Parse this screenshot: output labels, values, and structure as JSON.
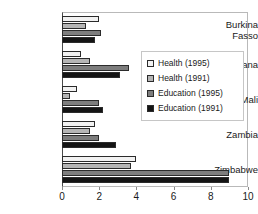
{
  "chart_data": {
    "type": "bar",
    "orientation": "horizontal",
    "title": "",
    "xlabel": "",
    "ylabel": "",
    "xlim": [
      0,
      10
    ],
    "xticks": [
      0,
      2,
      4,
      6,
      8,
      10
    ],
    "xtick_labels": [
      "0",
      "2",
      "4",
      "6",
      "8",
      "10"
    ],
    "grid": false,
    "legend_position": "center-right",
    "categories": [
      "Burkina\nFasso",
      "Ghana",
      "Mali",
      "Zambia",
      "Zimbabwe"
    ],
    "series": [
      {
        "name": "Health (1995)",
        "values": [
          2.0,
          1.0,
          0.8,
          1.8,
          4.0
        ]
      },
      {
        "name": "Health (1991)",
        "values": [
          1.3,
          1.5,
          0.45,
          1.5,
          3.7
        ]
      },
      {
        "name": "Education (1995)",
        "values": [
          2.1,
          3.6,
          2.0,
          2.0,
          9.0
        ]
      },
      {
        "name": "Education (1991)",
        "values": [
          1.8,
          3.1,
          2.2,
          2.9,
          9.0
        ]
      }
    ],
    "series_colors": [
      "#f2f2f2",
      "#b5b5b5",
      "#7d7d7d",
      "#141414"
    ]
  },
  "legend": {
    "items": [
      {
        "label": "Health (1995)"
      },
      {
        "label": "Health (1991)"
      },
      {
        "label": "Education (1995)"
      },
      {
        "label": "Education (1991)"
      }
    ]
  }
}
